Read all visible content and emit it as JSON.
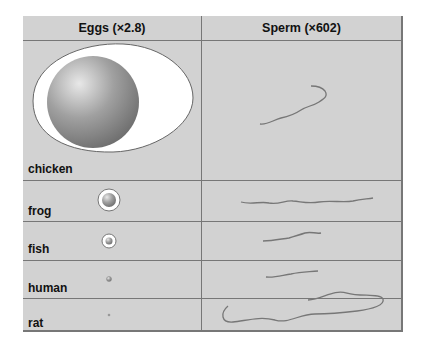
{
  "headers": {
    "eggs": "Eggs (×2.8)",
    "sperm": "Sperm (×602)"
  },
  "rows": [
    {
      "species": "chicken"
    },
    {
      "species": "frog"
    },
    {
      "species": "fish"
    },
    {
      "species": "human"
    },
    {
      "species": "rat"
    }
  ],
  "colors": {
    "background": "#d2d2d2",
    "grid": "#777777",
    "egg_white": "#ffffff",
    "yolk": "#8f8f8f"
  }
}
